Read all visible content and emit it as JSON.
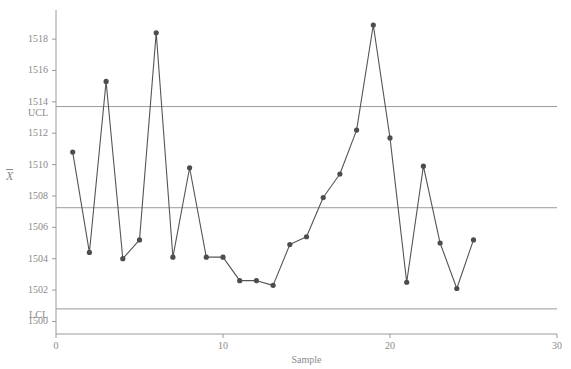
{
  "chart_data": {
    "type": "line",
    "title": "",
    "subtitle": "",
    "xlabel": "Sample",
    "ylabel": "X",
    "ylabel_note": "X-bar",
    "x": [
      1,
      2,
      3,
      4,
      5,
      6,
      7,
      8,
      9,
      10,
      11,
      12,
      13,
      14,
      15,
      16,
      17,
      18,
      19,
      20,
      21,
      22,
      23,
      24,
      25
    ],
    "values": [
      1510.8,
      1504.4,
      1515.3,
      1504.0,
      1505.2,
      1518.4,
      1504.1,
      1509.8,
      1504.1,
      1504.1,
      1502.6,
      1502.6,
      1502.3,
      1504.9,
      1505.4,
      1507.9,
      1509.4,
      1512.2,
      1518.9,
      1511.7,
      1502.5,
      1509.9,
      1505.0,
      1502.1,
      1505.2
    ],
    "series": [
      {
        "name": "X",
        "values": [
          1510.8,
          1504.4,
          1515.3,
          1504.0,
          1505.2,
          1518.4,
          1504.1,
          1509.8,
          1504.1,
          1504.1,
          1502.6,
          1502.6,
          1502.3,
          1504.9,
          1505.4,
          1507.9,
          1509.4,
          1512.2,
          1518.9,
          1511.7,
          1502.5,
          1509.9,
          1505.0,
          1502.1,
          1505.2
        ]
      }
    ],
    "xlim": [
      0,
      30
    ],
    "ylim": [
      1499.2,
      1519.6
    ],
    "xticks": [
      0,
      10,
      20,
      30
    ],
    "xticklabels": [
      "0",
      "10",
      "20",
      "30"
    ],
    "yticks": [
      1500,
      1502,
      1504,
      1506,
      1508,
      1510,
      1512,
      1514,
      1516,
      1518
    ],
    "yticklabels": [
      "1500",
      "1502",
      "1504",
      "1506",
      "1508",
      "1510",
      "1512",
      "1514",
      "1516",
      "1518"
    ],
    "grid": false,
    "legend": "none",
    "control_limits": {
      "ucl": {
        "label": "UCL",
        "value": 1513.7
      },
      "center": {
        "label": "",
        "value": 1507.25
      },
      "lcl": {
        "label": "LCL",
        "value": 1500.8
      }
    },
    "colors": {
      "line": "#555555",
      "marker": "#4d4d4d",
      "control_line": "#9a9a9a",
      "axis": "#9a9a9a",
      "text": "#8a8a8a",
      "background": "#ffffff"
    },
    "marker_size": 3
  }
}
